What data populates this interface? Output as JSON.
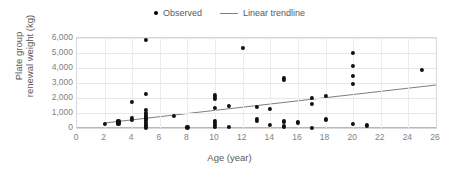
{
  "chart_data": {
    "type": "scatter",
    "title": "",
    "xlabel": "Age (year)",
    "ylabel": "Plate group renewal weight (kg)",
    "ylabel_line1": "Plate group",
    "ylabel_line2": "renewal weight (kg)",
    "xlim": [
      0,
      26
    ],
    "ylim": [
      0,
      6000
    ],
    "xticks": [
      "0",
      "2",
      "4",
      "6",
      "8",
      "10",
      "12",
      "14",
      "16",
      "18",
      "20",
      "22",
      "24",
      "26"
    ],
    "xtick_values": [
      0,
      2,
      4,
      6,
      8,
      10,
      12,
      14,
      16,
      18,
      20,
      22,
      24,
      26
    ],
    "yticks": [
      "0",
      "1,000",
      "2,000",
      "3,000",
      "4,000",
      "5,000",
      "6,000"
    ],
    "ytick_values": [
      0,
      1000,
      2000,
      3000,
      4000,
      5000,
      6000
    ],
    "grid": true,
    "grid_axis": "both",
    "legend_position": "top",
    "legend": [
      {
        "label": "Observed",
        "marker": "circle",
        "color": "#111111"
      },
      {
        "label": "Linear trendline",
        "marker": "line",
        "color": "#7f7f7f"
      }
    ],
    "series": [
      {
        "name": "Observed",
        "marker": "circle",
        "color": "#111111",
        "points": [
          [
            2,
            270
          ],
          [
            3,
            330
          ],
          [
            3,
            400
          ],
          [
            3,
            470
          ],
          [
            3,
            300
          ],
          [
            4,
            1750
          ],
          [
            4,
            700
          ],
          [
            4,
            520
          ],
          [
            5,
            5850
          ],
          [
            5,
            2300
          ],
          [
            5,
            1180
          ],
          [
            5,
            1020
          ],
          [
            5,
            880
          ],
          [
            5,
            760
          ],
          [
            5,
            640
          ],
          [
            5,
            520
          ],
          [
            5,
            400
          ],
          [
            5,
            280
          ],
          [
            5,
            170
          ],
          [
            5,
            90
          ],
          [
            5,
            30
          ],
          [
            7,
            800
          ],
          [
            8,
            40
          ],
          [
            10,
            2200
          ],
          [
            10,
            2080
          ],
          [
            10,
            1950
          ],
          [
            10,
            1350
          ],
          [
            10,
            460
          ],
          [
            10,
            330
          ],
          [
            10,
            210
          ],
          [
            10,
            90
          ],
          [
            11,
            1480
          ],
          [
            11,
            60
          ],
          [
            12,
            5350
          ],
          [
            13,
            1430
          ],
          [
            13,
            620
          ],
          [
            13,
            500
          ],
          [
            14,
            1250
          ],
          [
            14,
            230
          ],
          [
            15,
            3330
          ],
          [
            15,
            3230
          ],
          [
            15,
            460
          ],
          [
            15,
            380
          ],
          [
            15,
            120
          ],
          [
            15,
            60
          ],
          [
            16,
            370
          ],
          [
            17,
            1980
          ],
          [
            17,
            1620
          ],
          [
            17,
            30
          ],
          [
            18,
            2140
          ],
          [
            18,
            590
          ],
          [
            18,
            520
          ],
          [
            20,
            5000
          ],
          [
            20,
            4150
          ],
          [
            20,
            3450
          ],
          [
            20,
            2950
          ],
          [
            20,
            270
          ],
          [
            21,
            170
          ],
          [
            25,
            3900
          ]
        ]
      }
    ],
    "trendline": {
      "name": "Linear trendline",
      "color": "#7f7f7f",
      "x_start": 2,
      "y_start": 330,
      "x_end": 26,
      "y_end": 2870
    }
  }
}
